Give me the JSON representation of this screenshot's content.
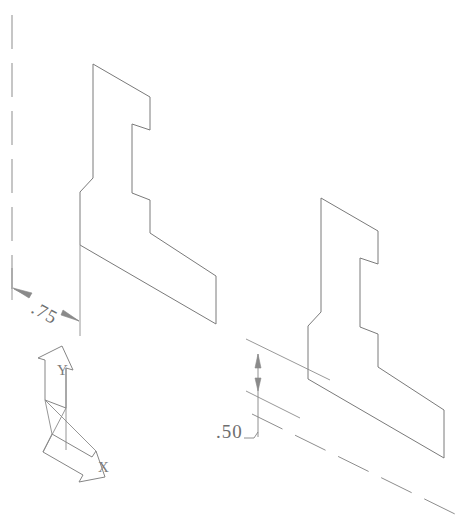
{
  "drawing": {
    "title": "Isometric Part Drawing",
    "background_color": "#ffffff",
    "line_color": "#7a7a7a",
    "view_type": "isometric",
    "dimensions": [
      {
        "id": "dim-075",
        "value": ".75",
        "orientation": "iso-left-slanted",
        "text_rotation_deg": 28,
        "text_x": 30,
        "text_y": 312
      },
      {
        "id": "dim-050",
        "value": ".50",
        "orientation": "vertical",
        "text_rotation_deg": 0,
        "text_x": 216,
        "text_y": 438
      }
    ],
    "axis_indicator": {
      "name": "isometric-axis-triad",
      "labels": [
        {
          "id": "axis-y",
          "text": "Y",
          "x": 57,
          "y": 375
        },
        {
          "id": "axis-x",
          "text": "X",
          "x": 105,
          "y": 462
        }
      ]
    },
    "centerlines": [
      {
        "id": "centerline-vertical-left",
        "x1": 12,
        "y1": 15,
        "x2": 12,
        "y2": 302
      },
      {
        "id": "centerline-diagonal-bottom",
        "x1": 252,
        "y1": 414,
        "x2": 459,
        "y2": 516
      }
    ],
    "shapes": [
      {
        "id": "profile-part-left",
        "points": "93,64 150,97 150,130 132,124 132,193 150,200 150,233 216,276 216,324 80,245 80,192 93,178"
      },
      {
        "id": "profile-part-right",
        "points": "321,198 378,231 378,264 360,258 360,327 378,334 378,367 444,410 444,458 308,379 308,326 321,312"
      }
    ]
  }
}
